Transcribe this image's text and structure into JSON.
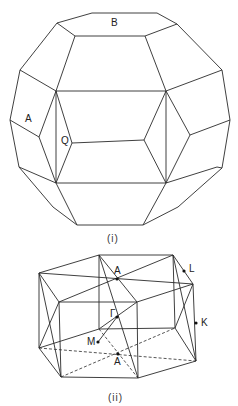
{
  "figure_i": {
    "caption": "(i)",
    "labels": {
      "B": "B",
      "A": "A",
      "Q": "Q"
    }
  },
  "figure_ii": {
    "caption": "(ii)",
    "labels": {
      "A_top": "A",
      "L": "L",
      "K": "K",
      "Gamma": "Γ",
      "M": "M",
      "A_bottom": "A"
    }
  },
  "colors": {
    "line": "#2a2a2a",
    "background": "#ffffff"
  }
}
